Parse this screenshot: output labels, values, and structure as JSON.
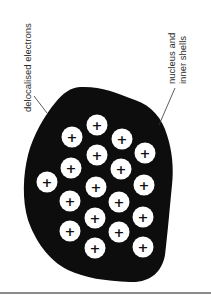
{
  "diagram": {
    "labels": {
      "electrons": "delocalised electrons",
      "ions_line1": "nucleus and",
      "ions_line2": "inner shells"
    },
    "ion_symbol": "+",
    "ions": [
      {
        "x": 97,
        "y": 125
      },
      {
        "x": 72,
        "y": 137
      },
      {
        "x": 122,
        "y": 139
      },
      {
        "x": 97,
        "y": 155
      },
      {
        "x": 145,
        "y": 153
      },
      {
        "x": 71,
        "y": 168
      },
      {
        "x": 121,
        "y": 169
      },
      {
        "x": 47,
        "y": 182
      },
      {
        "x": 96,
        "y": 187
      },
      {
        "x": 144,
        "y": 185
      },
      {
        "x": 70,
        "y": 201
      },
      {
        "x": 119,
        "y": 202
      },
      {
        "x": 95,
        "y": 218
      },
      {
        "x": 143,
        "y": 217
      },
      {
        "x": 70,
        "y": 231
      },
      {
        "x": 119,
        "y": 232
      },
      {
        "x": 95,
        "y": 248
      },
      {
        "x": 143,
        "y": 247
      }
    ],
    "colors": {
      "sea": "#0d0d0d",
      "ion_fill": "#ffffff",
      "text": "#2a2a2a",
      "divider": "#8a8a8a"
    }
  }
}
